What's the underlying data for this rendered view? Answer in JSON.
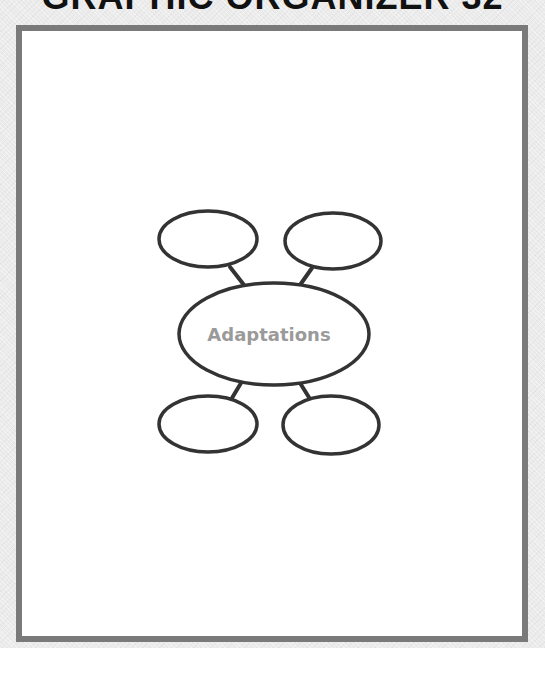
{
  "document": {
    "title": "GRAPHIC ORGANIZER 32"
  },
  "diagram": {
    "type": "concept-web",
    "center": {
      "label": "Adaptations"
    },
    "satellites": [
      {
        "position": "top-left",
        "label": ""
      },
      {
        "position": "top-right",
        "label": ""
      },
      {
        "position": "bottom-left",
        "label": ""
      },
      {
        "position": "bottom-right",
        "label": ""
      }
    ]
  },
  "colors": {
    "frame_border": "#7a7a7a",
    "outline": "#333333",
    "center_text": "#9a9a9a",
    "background": "#ebebeb"
  }
}
